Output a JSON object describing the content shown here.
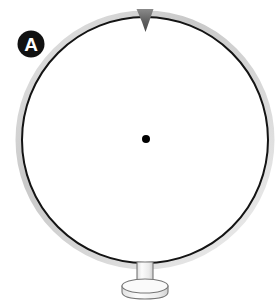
{
  "figure": {
    "label": "A",
    "caption": "",
    "background_color": "#ffffff",
    "panel_label": {
      "text": "A",
      "badge_fill": "#111111",
      "text_color": "#ffffff",
      "center_x": 31,
      "center_y": 44,
      "radius": 13.5
    },
    "wheel": {
      "name": "rotor-ring",
      "center_x": 145,
      "center_y": 140,
      "radius": 123,
      "stroke_color": "#141414",
      "stroke_width": 2,
      "fill_color": "#ffffff",
      "halo_color": "#cfcfcf",
      "halo_width": 7
    },
    "pointer": {
      "name": "top-marker",
      "shape": "triangle-down",
      "fill_color": "#6b6b6b",
      "apex_x": 145,
      "apex_y": 32,
      "left_x": 137,
      "right_x": 153,
      "top_y": 8
    },
    "hub": {
      "name": "center-dot",
      "center_x": 146,
      "center_y": 139,
      "radius": 4,
      "fill_color": "#000000"
    },
    "stand": {
      "name": "pedestal",
      "stem_color": "#f2f2f2",
      "stem_stroke": "#6f6f6f",
      "base_color": "#f4f4f4",
      "base_stroke": "#6f6f6f",
      "stem_x": 137,
      "stem_y": 264,
      "stem_width": 15,
      "stem_height": 22,
      "base_center_x": 145,
      "base_center_y": 286,
      "base_rx": 23,
      "base_ry": 7,
      "base_depth": 9
    }
  }
}
